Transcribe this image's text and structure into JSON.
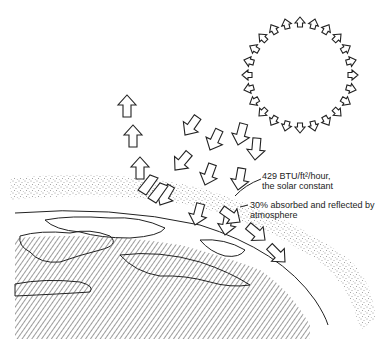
{
  "diagram": {
    "labels": {
      "solar_constant_line1": "429 BTU/ft²/hour,",
      "solar_constant_line2": "the solar constant",
      "absorbed_line1": "30% absorbed and reflected by",
      "absorbed_line2": "atmosphere"
    },
    "elements": {
      "sun": "sun-ring-of-arrows",
      "incoming": "incoming-solar-arrows",
      "reflected": "reflected-arrows-upward",
      "scattered": "scattered-arrows-along-atmosphere",
      "atmosphere": "stippled-atmosphere-band",
      "earth": "hatched-earth-surface"
    },
    "colors": {
      "ink": "#222222",
      "paper": "#ffffff"
    }
  }
}
